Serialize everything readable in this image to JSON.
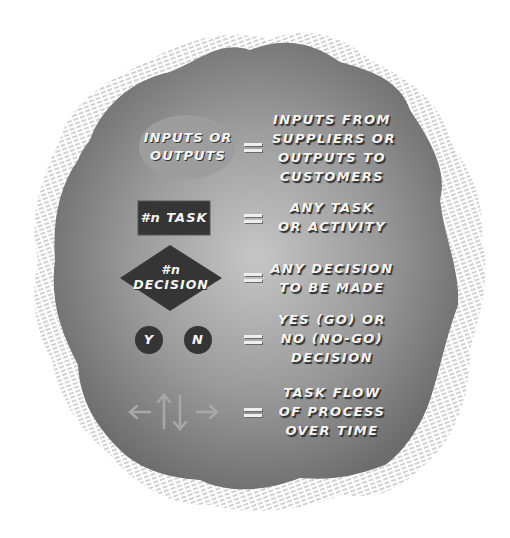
{
  "colors": {
    "blob_center": "#c4c4c4",
    "blob_edge": "#6e6e6e",
    "ellipse_fill": "#9d9d9d",
    "dark_shape_fill": "#353535",
    "arrow_color": "#a8a8a8",
    "hatch_color": "#9a9a9a",
    "text_color": "#f4f4f4"
  },
  "legend": [
    {
      "symbol": "ellipse",
      "symbol_label": "INPUTS OR\nOUTPUTS",
      "equals": "=",
      "meaning": "INPUTS FROM\nSUPPLIERS OR\nOUTPUTS TO\nCUSTOMERS"
    },
    {
      "symbol": "rectangle",
      "symbol_label": "#n TASK",
      "equals": "=",
      "meaning": "ANY TASK\nOR ACTIVITY"
    },
    {
      "symbol": "diamond",
      "symbol_label": "#n\nDECISION",
      "equals": "=",
      "meaning": "ANY DECISION\nTO BE MADE"
    },
    {
      "symbol": "circles",
      "symbol_labels": [
        "Y",
        "N"
      ],
      "equals": "=",
      "meaning": "YES (GO) OR\nNO (NO-GO)\nDECISION"
    },
    {
      "symbol": "arrows",
      "symbol_icons": [
        "arrow-left-icon",
        "arrow-up-icon",
        "arrow-down-icon",
        "arrow-right-icon"
      ],
      "equals": "=",
      "meaning": "TASK FLOW\nOF PROCESS\nOVER TIME"
    }
  ]
}
